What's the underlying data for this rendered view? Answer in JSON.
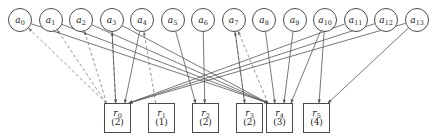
{
  "figure": {
    "width": 442,
    "height": 137,
    "background_color": "#ffffff",
    "edge_color": "#555555",
    "node_stroke_color": "#4a4a4a",
    "text_color": "#1a1a1a"
  },
  "agents": [
    {
      "id": "a0",
      "label": "a",
      "sub": "0",
      "cx": 20,
      "cy": 20,
      "r": 12
    },
    {
      "id": "a1",
      "label": "a",
      "sub": "1",
      "cx": 50.5,
      "cy": 20,
      "r": 12
    },
    {
      "id": "a2",
      "label": "a",
      "sub": "2",
      "cx": 81,
      "cy": 20,
      "r": 12
    },
    {
      "id": "a3",
      "label": "a",
      "sub": "3",
      "cx": 111.5,
      "cy": 20,
      "r": 12
    },
    {
      "id": "a4",
      "label": "a",
      "sub": "4",
      "cx": 142,
      "cy": 20,
      "r": 12
    },
    {
      "id": "a5",
      "label": "a",
      "sub": "5",
      "cx": 172.5,
      "cy": 20,
      "r": 12
    },
    {
      "id": "a6",
      "label": "a",
      "sub": "6",
      "cx": 203,
      "cy": 20,
      "r": 12
    },
    {
      "id": "a7",
      "label": "a",
      "sub": "7",
      "cx": 233.5,
      "cy": 20,
      "r": 12
    },
    {
      "id": "a8",
      "label": "a",
      "sub": "8",
      "cx": 264,
      "cy": 20,
      "r": 12
    },
    {
      "id": "a9",
      "label": "a",
      "sub": "9",
      "cx": 294.5,
      "cy": 20,
      "r": 12
    },
    {
      "id": "a10",
      "label": "a",
      "sub": "10",
      "cx": 325,
      "cy": 20,
      "r": 12
    },
    {
      "id": "a11",
      "label": "a",
      "sub": "11",
      "cx": 355.5,
      "cy": 20,
      "r": 12
    },
    {
      "id": "a12",
      "label": "a",
      "sub": "12",
      "cx": 386,
      "cy": 20,
      "r": 12
    },
    {
      "id": "a13",
      "label": "a",
      "sub": "13",
      "cx": 417,
      "cy": 20,
      "r": 12
    }
  ],
  "resources": [
    {
      "id": "r0",
      "label": "r",
      "sub": "0",
      "count": "(2)",
      "x": 104,
      "y": 103,
      "w": 27,
      "h": 30
    },
    {
      "id": "r1",
      "label": "r",
      "sub": "1",
      "count": "(1)",
      "x": 148,
      "y": 103,
      "w": 27,
      "h": 30
    },
    {
      "id": "r2",
      "label": "r",
      "sub": "2",
      "count": "(2)",
      "x": 192,
      "y": 103,
      "w": 27,
      "h": 30
    },
    {
      "id": "r3",
      "label": "r",
      "sub": "3",
      "count": "(2)",
      "x": 236,
      "y": 103,
      "w": 27,
      "h": 30
    },
    {
      "id": "r4",
      "label": "r",
      "sub": "4",
      "count": "(3)",
      "x": 266,
      "y": 103,
      "w": 27,
      "h": 30
    },
    {
      "id": "r5",
      "label": "r",
      "sub": "5",
      "count": "(4)",
      "x": 303,
      "y": 103,
      "w": 27,
      "h": 30
    }
  ],
  "edges": [
    {
      "from": "r0",
      "to": "a0",
      "style": "dashed",
      "arrow": "to-agent"
    },
    {
      "from": "r0",
      "to": "a1",
      "style": "dashed",
      "arrow": "to-agent"
    },
    {
      "from": "r0",
      "to": "a2",
      "style": "dashed",
      "arrow": "to-agent"
    },
    {
      "from": "r0",
      "to": "a3",
      "style": "dashed",
      "arrow": "to-agent"
    },
    {
      "from": "r1",
      "to": "a4",
      "style": "dashed",
      "arrow": "to-agent"
    },
    {
      "from": "r3",
      "to": "a7",
      "style": "dashed",
      "arrow": "to-agent"
    },
    {
      "from": "r4",
      "to": "a7",
      "style": "dashed",
      "arrow": "to-agent"
    },
    {
      "from": "a0",
      "to": "r4",
      "style": "solid",
      "arrow": "to-resource"
    },
    {
      "from": "a1",
      "to": "r4",
      "style": "solid",
      "arrow": "to-resource"
    },
    {
      "from": "a2",
      "to": "r4",
      "style": "solid",
      "arrow": "to-resource"
    },
    {
      "from": "a3",
      "to": "r0",
      "style": "solid",
      "arrow": "to-resource"
    },
    {
      "from": "a3",
      "to": "r4",
      "style": "solid",
      "arrow": "to-resource"
    },
    {
      "from": "a4",
      "to": "r0",
      "style": "solid",
      "arrow": "to-resource"
    },
    {
      "from": "a5",
      "to": "r2",
      "style": "solid",
      "arrow": "to-resource"
    },
    {
      "from": "a6",
      "to": "r2",
      "style": "solid",
      "arrow": "to-resource"
    },
    {
      "from": "a7",
      "to": "r3",
      "style": "solid",
      "arrow": "to-resource"
    },
    {
      "from": "a8",
      "to": "r4",
      "style": "solid",
      "arrow": "to-resource"
    },
    {
      "from": "a9",
      "to": "r4",
      "style": "solid",
      "arrow": "to-resource"
    },
    {
      "from": "a10",
      "to": "r4",
      "style": "solid",
      "arrow": "to-resource"
    },
    {
      "from": "a10",
      "to": "r5",
      "style": "solid",
      "arrow": "to-resource"
    },
    {
      "from": "a11",
      "to": "r0",
      "style": "solid",
      "arrow": "to-agent-left"
    },
    {
      "from": "a12",
      "to": "r0",
      "style": "solid",
      "arrow": "to-agent-left"
    },
    {
      "from": "a13",
      "to": "r0",
      "style": "solid",
      "arrow": "to-agent-left"
    },
    {
      "from": "a13",
      "to": "r5",
      "style": "solid",
      "arrow": "to-resource"
    }
  ]
}
